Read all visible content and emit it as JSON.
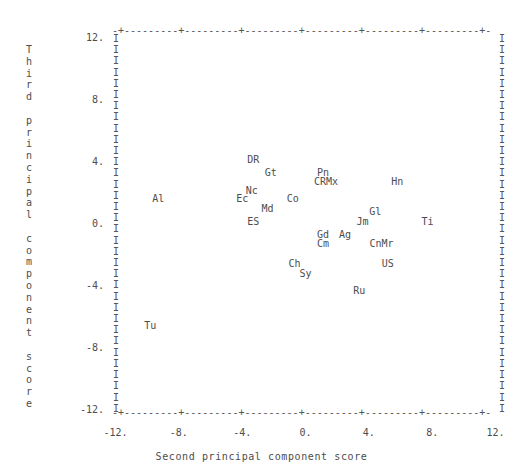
{
  "chart_data": {
    "type": "scatter",
    "title": "",
    "xlabel": "Second principal component score",
    "ylabel": "Third principal component score",
    "xlim": [
      -13.0,
      13.0
    ],
    "ylim": [
      -13.0,
      13.0
    ],
    "xticks": [
      "-12.",
      "-8.",
      "-4.",
      "0.",
      "4.",
      "8.",
      "12."
    ],
    "xtick_values": [
      -12,
      -8,
      -4,
      0,
      4,
      8,
      12
    ],
    "yticks": [
      "12.",
      "8.",
      "4.",
      "0.",
      "-4.",
      "-8.",
      "-12."
    ],
    "ytick_values": [
      12,
      8,
      4,
      0,
      -4,
      -8,
      -12
    ],
    "grid": false,
    "legend": null,
    "marker_style": "text-label",
    "frame_chars": {
      "horizontal": "-",
      "tick": "+",
      "vertical": "I"
    },
    "points": [
      {
        "label": "DR",
        "x": -3.3,
        "y": 4.1
      },
      {
        "label": "Gt",
        "x": -2.2,
        "y": 3.3
      },
      {
        "label": "Pn",
        "x": 1.1,
        "y": 3.3
      },
      {
        "label": "CRMx",
        "x": 1.3,
        "y": 2.7
      },
      {
        "label": "Hn",
        "x": 5.8,
        "y": 2.7
      },
      {
        "label": "Nc",
        "x": -3.4,
        "y": 2.1
      },
      {
        "label": "Ec",
        "x": -4.0,
        "y": 1.6
      },
      {
        "label": "Al",
        "x": -9.3,
        "y": 1.6
      },
      {
        "label": "Co",
        "x": -0.8,
        "y": 1.6
      },
      {
        "label": "Md",
        "x": -2.4,
        "y": 1.0
      },
      {
        "label": "Gl",
        "x": 4.4,
        "y": 0.8
      },
      {
        "label": "ES",
        "x": -3.3,
        "y": 0.1
      },
      {
        "label": "Jm",
        "x": 3.6,
        "y": 0.1
      },
      {
        "label": "Ti",
        "x": 7.7,
        "y": 0.1
      },
      {
        "label": "Gd",
        "x": 1.1,
        "y": -0.7
      },
      {
        "label": "Ag",
        "x": 2.5,
        "y": -0.7
      },
      {
        "label": "Cm",
        "x": 1.1,
        "y": -1.3
      },
      {
        "label": "CnMr",
        "x": 4.8,
        "y": -1.3
      },
      {
        "label": "Ch",
        "x": -0.7,
        "y": -2.6
      },
      {
        "label": "US",
        "x": 5.2,
        "y": -2.6
      },
      {
        "label": "Sy",
        "x": 0.0,
        "y": -3.2
      },
      {
        "label": "Ru",
        "x": 3.4,
        "y": -4.3
      },
      {
        "label": "Tu",
        "x": -9.8,
        "y": -6.6
      }
    ]
  },
  "frame": {
    "top_row": "-+---------+---------+---------+---------+---------+---------+-",
    "bottom_row": "-+---------+---------+---------+---------+---------+---------+-",
    "side_char": "I"
  },
  "axis_title_chars": {
    "y": [
      "T",
      "h",
      "i",
      "r",
      "d",
      "",
      "p",
      "r",
      "i",
      "n",
      "c",
      "i",
      "p",
      "a",
      "l",
      "",
      "c",
      "o",
      "m",
      "p",
      "o",
      "n",
      "e",
      "n",
      "t",
      "",
      "s",
      "c",
      "o",
      "r",
      "e"
    ]
  }
}
